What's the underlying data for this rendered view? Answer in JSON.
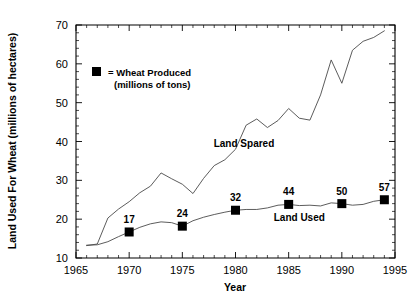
{
  "chart_data": {
    "type": "line",
    "title": "",
    "xlabel": "Year",
    "ylabel": "Land Used For Wheat (millions of hectares)",
    "xlim": [
      1965,
      1995
    ],
    "ylim": [
      10,
      70
    ],
    "xticks": [
      1965,
      1970,
      1975,
      1980,
      1985,
      1990,
      1995
    ],
    "xtick_labels": [
      "1965",
      "1970",
      "1975",
      "1980",
      "1985",
      "1990",
      "1995"
    ],
    "yticks": [
      10,
      20,
      30,
      40,
      50,
      60,
      70
    ],
    "ytick_labels": [
      "10",
      "20",
      "30",
      "40",
      "50",
      "60",
      "70"
    ],
    "grid": false,
    "legend": {
      "marker_symbol": "square",
      "line1": "= Wheat Produced",
      "line2": "(millions of tons)"
    },
    "annotations": [
      {
        "name": "land-spared-label",
        "text": "Land Spared",
        "x": 1980.8,
        "y": 38.5
      },
      {
        "name": "land-used-label",
        "text": "Land Used",
        "x": 1986.0,
        "y": 19.6
      }
    ],
    "series": [
      {
        "name": "Land Spared",
        "x": [
          1966,
          1967,
          1968,
          1969,
          1970,
          1971,
          1972,
          1973,
          1974,
          1975,
          1976,
          1977,
          1978,
          1979,
          1980,
          1981,
          1982,
          1983,
          1984,
          1985,
          1986,
          1987,
          1988,
          1989,
          1990,
          1991,
          1992,
          1993,
          1994
        ],
        "values": [
          13.2,
          13.6,
          20.3,
          22.6,
          24.5,
          26.8,
          28.5,
          31.9,
          30.4,
          29.0,
          26.6,
          30.5,
          33.8,
          35.3,
          38.0,
          44.2,
          45.8,
          43.6,
          45.4,
          48.5,
          46.0,
          45.5,
          52.0,
          61.0,
          55.0,
          63.5,
          65.8,
          66.8,
          68.5
        ]
      },
      {
        "name": "Land Used",
        "x": [
          1966,
          1967,
          1968,
          1969,
          1970,
          1971,
          1972,
          1973,
          1974,
          1975,
          1976,
          1977,
          1978,
          1979,
          1980,
          1981,
          1982,
          1983,
          1984,
          1985,
          1986,
          1987,
          1988,
          1989,
          1990,
          1991,
          1992,
          1993,
          1994
        ],
        "values": [
          13.3,
          13.4,
          14.2,
          15.5,
          16.7,
          17.9,
          18.8,
          19.3,
          19.1,
          18.2,
          19.6,
          20.5,
          21.2,
          21.8,
          22.3,
          22.5,
          22.5,
          22.9,
          23.6,
          23.8,
          23.5,
          23.6,
          23.4,
          24.2,
          24.0,
          23.6,
          23.8,
          24.6,
          25.0
        ]
      }
    ],
    "wheat_produced_points": [
      {
        "year": 1970,
        "label": "17",
        "land_used": 16.7
      },
      {
        "year": 1975,
        "label": "24",
        "land_used": 18.2
      },
      {
        "year": 1980,
        "label": "32",
        "land_used": 22.3
      },
      {
        "year": 1985,
        "label": "44",
        "land_used": 23.8
      },
      {
        "year": 1990,
        "label": "50",
        "land_used": 24.0
      },
      {
        "year": 1994,
        "label": "57",
        "land_used": 25.0
      }
    ],
    "colors": {
      "line": "#4a4a4a",
      "marker": "#000000",
      "axis": "#000000",
      "background": "#ffffff"
    }
  }
}
